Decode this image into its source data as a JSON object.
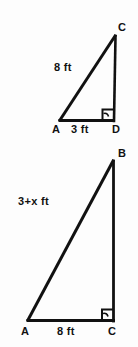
{
  "figure": {
    "background_color": "#fdfdfd",
    "stroke_color": "#111111",
    "upper_triangle": {
      "name": "triangle-acd",
      "vertices": {
        "a": "A",
        "d": "D",
        "c": "C"
      },
      "hypotenuse_label": "8 ft",
      "base_label": "3 ft",
      "right_angle_at": "D",
      "geometry": {
        "a_x": 60,
        "a_y": 120,
        "d_x": 113,
        "d_y": 120,
        "c_x": 115,
        "c_y": 35
      }
    },
    "lower_triangle": {
      "name": "triangle-abc",
      "vertices": {
        "a": "A",
        "b": "B",
        "c": "C"
      },
      "hypotenuse_label": "3+x ft",
      "base_label": "8 ft",
      "right_angle_at": "C",
      "geometry": {
        "a_x": 28,
        "a_y": 320,
        "c_x": 113,
        "c_y": 320,
        "b_x": 113,
        "b_y": 160
      }
    }
  }
}
